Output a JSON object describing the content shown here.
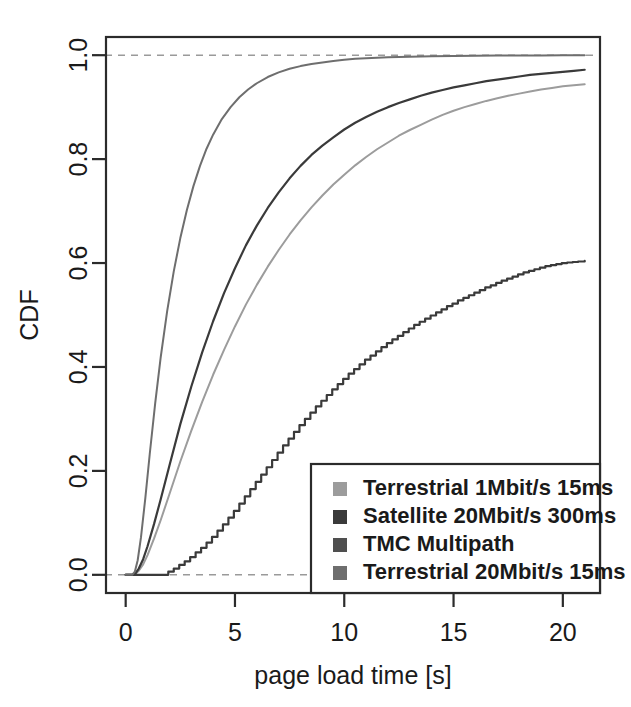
{
  "chart_data": {
    "type": "line",
    "title": "",
    "xlabel": "page load time [s]",
    "ylabel": "CDF",
    "xlim": [
      -0.9,
      21.7
    ],
    "ylim": [
      -0.035,
      1.035
    ],
    "xticks": [
      0,
      5,
      10,
      15,
      20
    ],
    "xtick_labels": [
      "0",
      "5",
      "10",
      "15",
      "20"
    ],
    "yticks": [
      0.0,
      0.2,
      0.4,
      0.6,
      0.8,
      1.0
    ],
    "ytick_labels": [
      "0.0",
      "0.2",
      "0.4",
      "0.6",
      "0.8",
      "1.0"
    ],
    "grid": false,
    "reference_lines": [
      {
        "axis": "y",
        "value": 1.0,
        "style": "dashed",
        "color": "#9a9a9a"
      },
      {
        "axis": "y",
        "value": 0.0,
        "style": "dashed",
        "color": "#9a9a9a"
      }
    ],
    "legend_position": "bottom-right",
    "series": [
      {
        "name": "Terrestrial 1Mbit/s 15ms",
        "color": "#9c9c9c",
        "width": 2.0,
        "step": false,
        "x": [
          0.0,
          0.3,
          0.45,
          0.6,
          0.8,
          1.0,
          1.3,
          1.6,
          2.0,
          2.5,
          3.0,
          3.5,
          4.0,
          4.5,
          5.0,
          5.5,
          6.0,
          6.5,
          7.0,
          7.5,
          8.0,
          8.5,
          9.0,
          9.5,
          10.0,
          10.5,
          11.0,
          11.5,
          12.0,
          12.5,
          13.0,
          13.5,
          14.0,
          14.5,
          15.0,
          15.5,
          16.0,
          16.5,
          17.0,
          17.5,
          18.0,
          18.5,
          19.0,
          19.5,
          20.0,
          20.5,
          21.0
        ],
        "y": [
          0.0,
          0.0,
          0.002,
          0.008,
          0.02,
          0.038,
          0.07,
          0.105,
          0.155,
          0.218,
          0.277,
          0.333,
          0.385,
          0.433,
          0.478,
          0.52,
          0.558,
          0.593,
          0.625,
          0.655,
          0.682,
          0.707,
          0.73,
          0.751,
          0.77,
          0.788,
          0.804,
          0.819,
          0.832,
          0.845,
          0.856,
          0.866,
          0.876,
          0.885,
          0.893,
          0.9,
          0.906,
          0.912,
          0.917,
          0.922,
          0.926,
          0.93,
          0.934,
          0.937,
          0.94,
          0.942,
          0.944
        ]
      },
      {
        "name": "Satellite 20Mbit/s 300ms",
        "color": "#3a3a3a",
        "width": 2.2,
        "step": false,
        "x": [
          0.0,
          0.3,
          0.45,
          0.6,
          0.8,
          1.0,
          1.3,
          1.6,
          2.0,
          2.5,
          3.0,
          3.5,
          4.0,
          4.5,
          5.0,
          5.5,
          6.0,
          6.5,
          7.0,
          7.5,
          8.0,
          8.5,
          9.0,
          9.5,
          10.0,
          10.5,
          11.0,
          11.5,
          12.0,
          12.5,
          13.0,
          13.5,
          14.0,
          14.5,
          15.0,
          15.5,
          16.0,
          16.5,
          17.0,
          17.5,
          18.0,
          18.5,
          19.0,
          19.5,
          20.0,
          20.5,
          21.0
        ],
        "y": [
          0.0,
          0.0,
          0.003,
          0.012,
          0.03,
          0.055,
          0.098,
          0.145,
          0.21,
          0.29,
          0.362,
          0.428,
          0.488,
          0.542,
          0.59,
          0.634,
          0.672,
          0.706,
          0.736,
          0.763,
          0.787,
          0.808,
          0.826,
          0.842,
          0.857,
          0.87,
          0.881,
          0.891,
          0.9,
          0.908,
          0.915,
          0.922,
          0.928,
          0.933,
          0.938,
          0.942,
          0.946,
          0.95,
          0.953,
          0.956,
          0.959,
          0.962,
          0.964,
          0.966,
          0.968,
          0.97,
          0.972
        ]
      },
      {
        "name": "TMC Multipath",
        "color": "#3a3a3a",
        "width": 2.2,
        "step": true,
        "x": [
          0.0,
          1.7,
          1.95,
          2.2,
          2.45,
          2.7,
          2.95,
          3.2,
          3.45,
          3.7,
          3.95,
          4.2,
          4.45,
          4.7,
          4.95,
          5.2,
          5.45,
          5.7,
          5.95,
          6.2,
          6.45,
          6.7,
          6.95,
          7.2,
          7.45,
          7.7,
          7.95,
          8.2,
          8.45,
          8.7,
          8.95,
          9.2,
          9.45,
          9.7,
          9.95,
          10.2,
          10.45,
          10.7,
          10.95,
          11.2,
          11.45,
          11.7,
          11.95,
          12.2,
          12.45,
          12.7,
          12.95,
          13.2,
          13.45,
          13.7,
          13.95,
          14.2,
          14.45,
          14.7,
          14.95,
          15.2,
          15.45,
          15.7,
          15.95,
          16.2,
          16.45,
          16.7,
          16.95,
          17.2,
          17.45,
          17.7,
          17.95,
          18.2,
          18.45,
          18.7,
          18.95,
          19.2,
          19.45,
          19.7,
          19.95,
          20.2,
          20.45,
          20.7,
          21.0
        ],
        "y": [
          0.0,
          0.0,
          0.006,
          0.012,
          0.019,
          0.026,
          0.034,
          0.043,
          0.052,
          0.062,
          0.073,
          0.085,
          0.097,
          0.11,
          0.123,
          0.137,
          0.151,
          0.165,
          0.179,
          0.193,
          0.207,
          0.221,
          0.235,
          0.249,
          0.262,
          0.275,
          0.288,
          0.3,
          0.312,
          0.324,
          0.335,
          0.346,
          0.357,
          0.367,
          0.377,
          0.387,
          0.396,
          0.405,
          0.414,
          0.422,
          0.43,
          0.438,
          0.446,
          0.453,
          0.46,
          0.467,
          0.474,
          0.481,
          0.487,
          0.493,
          0.499,
          0.505,
          0.511,
          0.517,
          0.522,
          0.528,
          0.533,
          0.538,
          0.543,
          0.548,
          0.553,
          0.557,
          0.562,
          0.566,
          0.57,
          0.574,
          0.578,
          0.582,
          0.585,
          0.588,
          0.591,
          0.594,
          0.596,
          0.598,
          0.6,
          0.601,
          0.602,
          0.603,
          0.604
        ]
      },
      {
        "name": "Terrestrial 20Mbit/s 15ms",
        "color": "#6e6e6e",
        "width": 2.0,
        "step": false,
        "x": [
          0.0,
          0.3,
          0.42,
          0.55,
          0.7,
          0.9,
          1.1,
          1.35,
          1.6,
          1.9,
          2.2,
          2.5,
          2.8,
          3.1,
          3.4,
          3.7,
          4.0,
          4.4,
          4.8,
          5.2,
          5.6,
          6.0,
          6.5,
          7.0,
          7.5,
          8.0,
          8.5,
          9.0,
          9.5,
          10.0,
          10.5,
          11.0,
          11.5,
          12.0,
          13.0,
          14.0,
          15.0,
          16.0,
          17.0,
          18.0,
          19.0,
          20.0,
          21.0
        ],
        "y": [
          0.0,
          0.0,
          0.006,
          0.028,
          0.072,
          0.148,
          0.232,
          0.33,
          0.418,
          0.508,
          0.584,
          0.648,
          0.702,
          0.748,
          0.787,
          0.82,
          0.847,
          0.877,
          0.9,
          0.919,
          0.934,
          0.946,
          0.958,
          0.967,
          0.974,
          0.979,
          0.983,
          0.986,
          0.989,
          0.991,
          0.993,
          0.994,
          0.995,
          0.996,
          0.997,
          0.998,
          0.9985,
          0.999,
          0.9992,
          0.9994,
          0.9996,
          0.9997,
          0.9998
        ]
      }
    ]
  },
  "legend": {
    "items": [
      {
        "label": "Terrestrial 1Mbit/s 15ms",
        "swatch": "#9c9c9c"
      },
      {
        "label": "Satellite 20Mbit/s 300ms",
        "swatch": "#3a3a3a"
      },
      {
        "label": "TMC Multipath",
        "swatch": "#4f4f4f"
      },
      {
        "label": "Terrestrial 20Mbit/s 15ms",
        "swatch": "#6e6e6e"
      }
    ]
  },
  "colors": {
    "axis": "#2b2b2b",
    "text": "#1a1a1a",
    "reference_dash": "#9a9a9a",
    "background": "#ffffff"
  }
}
